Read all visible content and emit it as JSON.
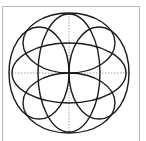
{
  "diagram": {
    "type": "geometric-knot-pattern",
    "colors": {
      "stroke": "#1a1a1a",
      "axis": "#8a8a8a",
      "frame": "#b8b8b8",
      "background": "#ffffff"
    },
    "center": [
      69,
      73
    ],
    "axes": {
      "horizontal": {
        "x1": 9,
        "x2": 130,
        "y": 73
      },
      "vertical": {
        "x": 69,
        "y1": 13,
        "y2": 133
      }
    },
    "ellipses": [
      {
        "name": "outer-top",
        "cx": 69,
        "cy": 43,
        "rx": 46,
        "ry": 30
      },
      {
        "name": "outer-bottom",
        "cx": 69,
        "cy": 103,
        "rx": 46,
        "ry": 30
      },
      {
        "name": "outer-left",
        "cx": 39,
        "cy": 73,
        "rx": 30,
        "ry": 46
      },
      {
        "name": "outer-right",
        "cx": 99,
        "cy": 73,
        "rx": 30,
        "ry": 46
      },
      {
        "name": "central-horizontal",
        "cx": 69,
        "cy": 73,
        "rx": 57,
        "ry": 30
      },
      {
        "name": "central-vertical",
        "cx": 69,
        "cy": 73,
        "rx": 31,
        "ry": 59
      }
    ]
  }
}
